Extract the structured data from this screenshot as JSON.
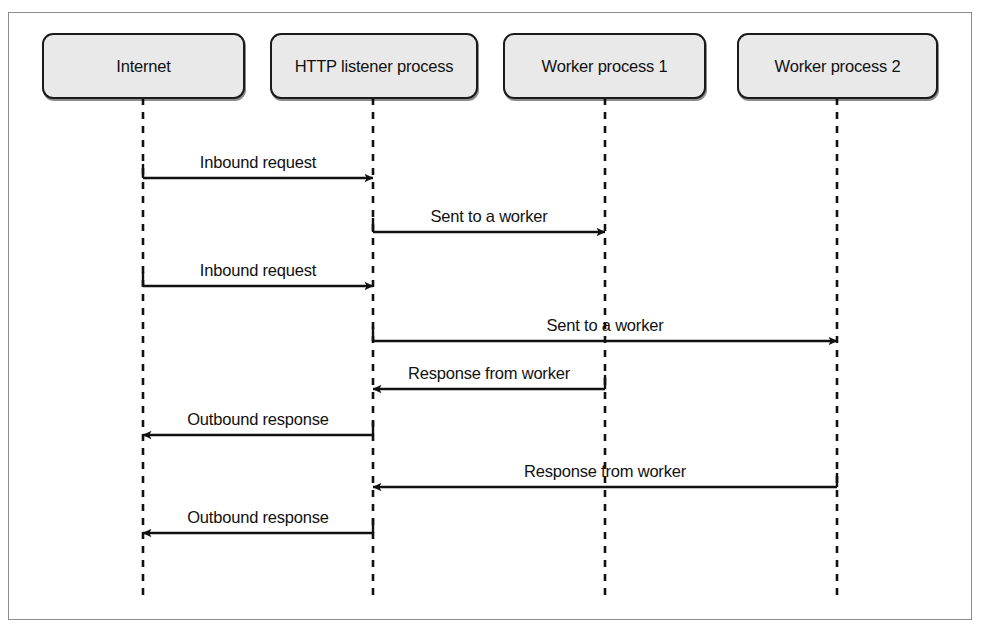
{
  "diagram": {
    "type": "sequence-diagram",
    "frame": {
      "stroke": "#8c8c8c"
    },
    "style": {
      "box_fill": "#e9e9e9",
      "box_stroke": "#1b1b1b",
      "line_color": "#111111",
      "lifeline_dash": "7,7"
    },
    "participants": [
      {
        "id": "internet",
        "label": "Internet",
        "x": 143,
        "box_left": 42,
        "box_width": 203
      },
      {
        "id": "http_listener",
        "label": "HTTP listener process",
        "x": 373,
        "box_left": 270,
        "box_width": 208
      },
      {
        "id": "worker1",
        "label": "Worker process 1",
        "x": 605,
        "box_left": 503,
        "box_width": 203
      },
      {
        "id": "worker2",
        "label": "Worker process 2",
        "x": 837,
        "box_left": 737,
        "box_width": 201
      }
    ],
    "messages": [
      {
        "seq": 1,
        "label": "Inbound request",
        "from": "internet",
        "to": "http_listener",
        "from_x": 143,
        "to_x": 373,
        "y": 178,
        "direction": "right"
      },
      {
        "seq": 2,
        "label": "Sent to a worker",
        "from": "http_listener",
        "to": "worker1",
        "from_x": 373,
        "to_x": 605,
        "y": 232,
        "direction": "right"
      },
      {
        "seq": 3,
        "label": "Inbound request",
        "from": "internet",
        "to": "http_listener",
        "from_x": 143,
        "to_x": 373,
        "y": 286,
        "direction": "right"
      },
      {
        "seq": 4,
        "label": "Sent to a worker",
        "from": "http_listener",
        "to": "worker2",
        "from_x": 373,
        "to_x": 837,
        "y": 341,
        "direction": "right"
      },
      {
        "seq": 5,
        "label": "Response from worker",
        "from": "worker1",
        "to": "http_listener",
        "from_x": 605,
        "to_x": 373,
        "y": 389,
        "direction": "left"
      },
      {
        "seq": 6,
        "label": "Outbound response",
        "from": "http_listener",
        "to": "internet",
        "from_x": 373,
        "to_x": 143,
        "y": 435,
        "direction": "left"
      },
      {
        "seq": 7,
        "label": "Response from worker",
        "from": "worker2",
        "to": "http_listener",
        "from_x": 837,
        "to_x": 373,
        "y": 487,
        "direction": "left"
      },
      {
        "seq": 8,
        "label": "Outbound response",
        "from": "http_listener",
        "to": "internet",
        "from_x": 373,
        "to_x": 143,
        "y": 533,
        "direction": "left"
      }
    ],
    "lifeline": {
      "top": 98,
      "bottom": 595
    }
  }
}
